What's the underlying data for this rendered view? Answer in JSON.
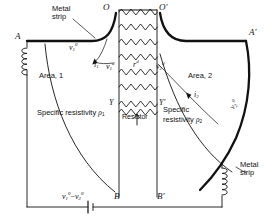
{
  "figure": {
    "kind": "circuit-field-diagram",
    "ink_color": "#111111",
    "background": "#ffffff"
  },
  "nodes": {
    "o_left": "O",
    "o_right": "O'",
    "a_left": "A",
    "a_right": "A'",
    "b_left": "B",
    "b_right": "B'",
    "y_left": "Y",
    "y_right": "Y'"
  },
  "labels": {
    "metal_strip_top": "Metal\nstrip",
    "metal_strip_top_l1": "Metal",
    "metal_strip_top_l2": "strip",
    "metal_strip_bottom_l1": "Metal",
    "metal_strip_bottom_l2": "strip",
    "area_one": "Area, 1",
    "area_two": "Area, 2",
    "resistivity_one_l1": "Specific resistivity",
    "resistivity_one_sym": "ρ",
    "resistivity_one_idx": "1",
    "resistivity_two_l1": "Specific",
    "resistivity_two_l2": "resistivity",
    "resistivity_two_sym": "ρ",
    "resistivity_two_idx": "2",
    "resistor_caption": "Resistor",
    "v1_surface": "v",
    "v1_surface_sub": "1",
    "v1_surface_sup": "0",
    "v2_surface": "v",
    "v2_surface_sub": "2",
    "v2_surface_sup": "0",
    "v1_d": "v",
    "v1_d_sub": "1",
    "v1_d_sup": "d",
    "v2_d": "v",
    "v2_d_sub": "2",
    "v2_d_sup": "d",
    "r_d": "r",
    "r_d_sup": "d",
    "current_one": "i",
    "current_one_sub": "1",
    "current_two": "i",
    "current_two_sub": "2",
    "emf_v1": "v",
    "emf_v1_sub": "1",
    "emf_v1_sup": "0",
    "emf_minus": "−",
    "emf_v2": "v",
    "emf_v2_sub": "2",
    "emf_v2_sup": "0"
  },
  "components": {
    "battery": "battery-source",
    "coil_left": "inductor-coil",
    "coil_right": "inductor-coil",
    "resistor_ladder_rungs": 8
  }
}
